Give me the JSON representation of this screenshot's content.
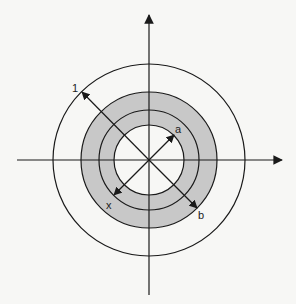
{
  "diagram": {
    "type": "annular-region-on-axes",
    "center": [
      149,
      160
    ],
    "colors": {
      "background": "#f7f7f5",
      "stroke": "#1a1a1a",
      "shade": "#c8c8c8"
    },
    "circles": {
      "inner_radius": 35,
      "middle_radius": 50,
      "shaded_outer_radius": 68,
      "outer_radius": 96
    },
    "labels": {
      "one": "1",
      "a": "a",
      "x": "x",
      "b": "b"
    }
  }
}
